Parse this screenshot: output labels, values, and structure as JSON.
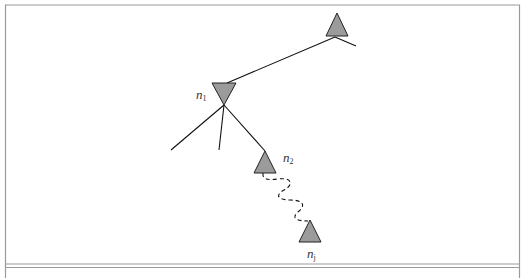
{
  "diagram": {
    "type": "tree",
    "colors": {
      "frame": "#9a9a9a",
      "node_fill": "#9b9b9b",
      "node_stroke": "#222222",
      "edge": "#111111",
      "label": "#333333"
    },
    "nodes": [
      {
        "id": "root",
        "shape": "triangle-up",
        "label": ""
      },
      {
        "id": "n1",
        "shape": "triangle-down",
        "label": "n",
        "subscript": "1"
      },
      {
        "id": "n2",
        "shape": "triangle-up",
        "label": "n",
        "subscript": "2"
      },
      {
        "id": "nj",
        "shape": "triangle-up",
        "label": "n",
        "subscript": "j"
      }
    ],
    "edges": [
      {
        "from": "root",
        "to": "n1",
        "style": "solid"
      },
      {
        "from": "root",
        "to": "(branch)",
        "style": "solid"
      },
      {
        "from": "n1",
        "to": "(branch-left)",
        "style": "solid"
      },
      {
        "from": "n1",
        "to": "(branch-middle)",
        "style": "solid"
      },
      {
        "from": "n1",
        "to": "n2",
        "style": "solid"
      },
      {
        "from": "n2",
        "to": "nj",
        "style": "dashed-wavy"
      }
    ]
  }
}
